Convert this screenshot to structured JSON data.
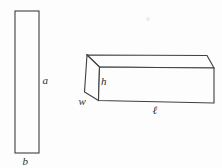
{
  "figure": {
    "thin_rectangle": {
      "side_label": "a",
      "base_label": "b"
    },
    "box": {
      "height_label": "h",
      "width_label": "w",
      "length_label": "ℓ"
    }
  },
  "colors": {
    "line": "#3f3f3f",
    "background": "#fdfdfd"
  }
}
